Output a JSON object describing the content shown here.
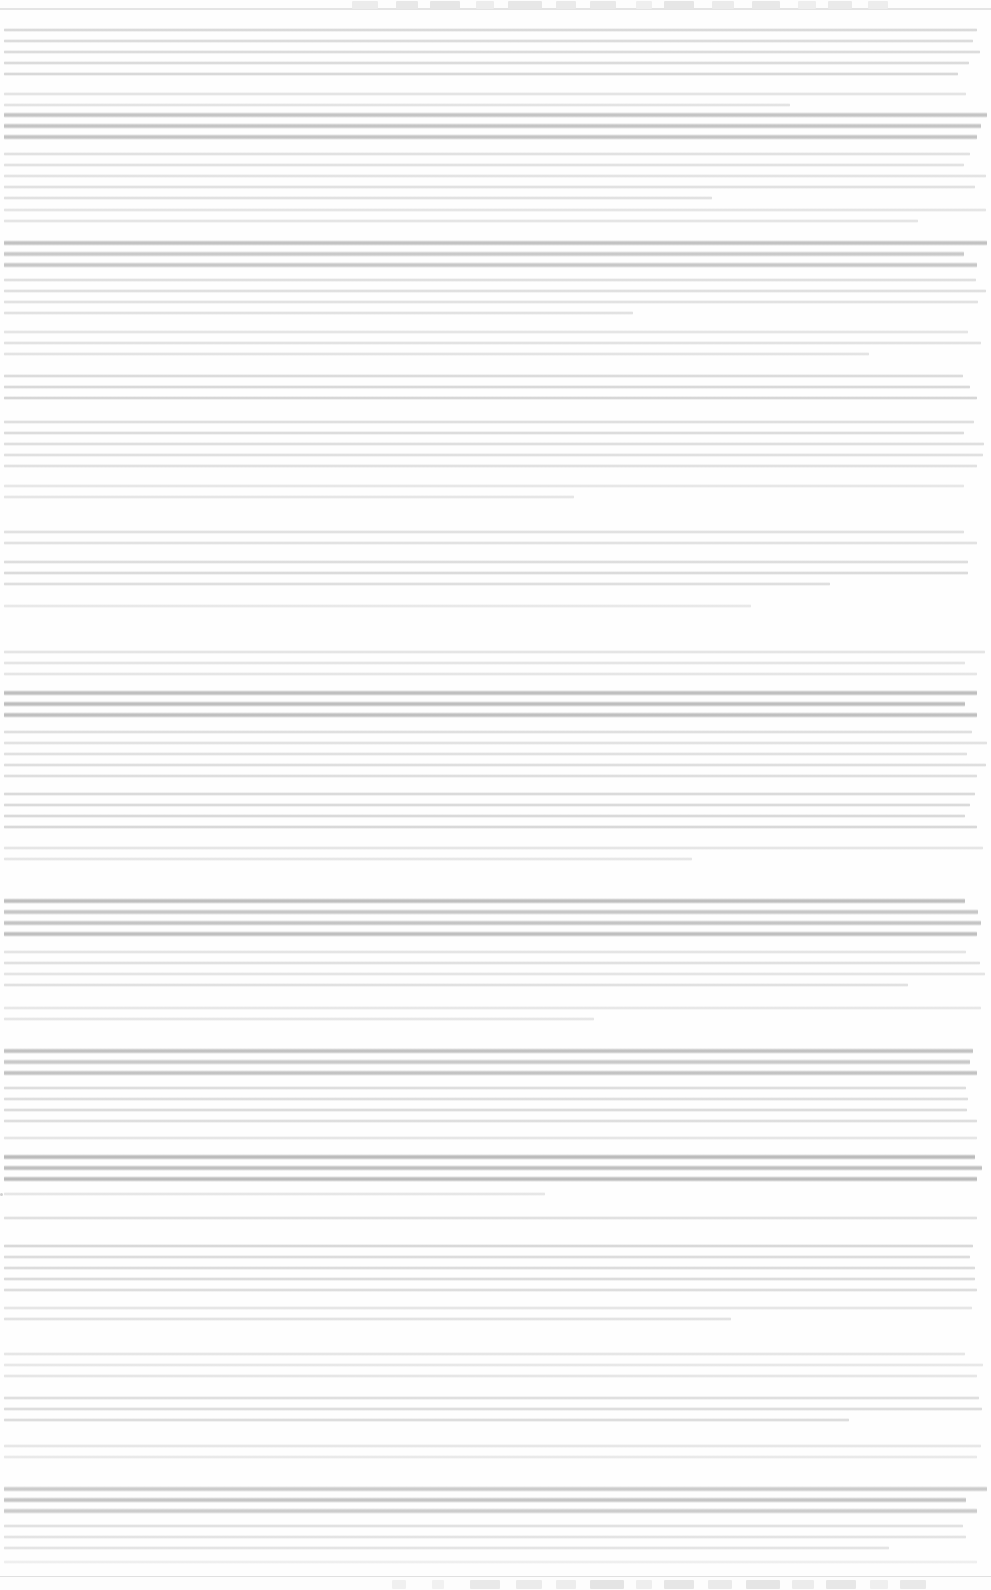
{
  "meta": {
    "width": 991,
    "height": 1590,
    "background": "#ffffff",
    "legibility": "none",
    "note": "Screenshot is extremely faded / washed out. No glyph shapes, labels, numbers or icon details are resolvable at any zoom level. Only horizontal text-line streaks, paragraph block boundaries and two chrome strips remain visible, so only geometry and tone are recorded below."
  },
  "window_chrome": {
    "name": "top-tab-strip",
    "top": 0,
    "height": 10,
    "background": "#fdfdfd",
    "rule_color": "#e4e4e4",
    "blocks": [
      {
        "x": 352,
        "w": 26,
        "tone": "#ececec"
      },
      {
        "x": 396,
        "w": 22,
        "tone": "#e8e8e8"
      },
      {
        "x": 430,
        "w": 30,
        "tone": "#e6e6e6"
      },
      {
        "x": 476,
        "w": 18,
        "tone": "#ededed"
      },
      {
        "x": 508,
        "w": 34,
        "tone": "#e7e7e7"
      },
      {
        "x": 556,
        "w": 20,
        "tone": "#eaeaea"
      },
      {
        "x": 590,
        "w": 26,
        "tone": "#e9e9e9"
      },
      {
        "x": 636,
        "w": 16,
        "tone": "#efefef"
      },
      {
        "x": 664,
        "w": 30,
        "tone": "#e6e6e6"
      },
      {
        "x": 712,
        "w": 22,
        "tone": "#ebebeb"
      },
      {
        "x": 752,
        "w": 28,
        "tone": "#e8e8e8"
      },
      {
        "x": 798,
        "w": 18,
        "tone": "#eeeeee"
      },
      {
        "x": 828,
        "w": 24,
        "tone": "#eaeaea"
      },
      {
        "x": 868,
        "w": 20,
        "tone": "#ededed"
      }
    ]
  },
  "taskbar": {
    "name": "bottom-taskbar",
    "height": 14,
    "background": "#fdfdfd",
    "rule_color": "#e0e0e0",
    "blocks": [
      {
        "x": 392,
        "w": 14,
        "tone": "#f0f0f0"
      },
      {
        "x": 432,
        "w": 12,
        "tone": "#f1f1f1"
      },
      {
        "x": 470,
        "w": 30,
        "tone": "#e9e9e9"
      },
      {
        "x": 516,
        "w": 26,
        "tone": "#ebebeb"
      },
      {
        "x": 556,
        "w": 20,
        "tone": "#ededed"
      },
      {
        "x": 590,
        "w": 34,
        "tone": "#e4e4e4"
      },
      {
        "x": 636,
        "w": 16,
        "tone": "#eeeeee"
      },
      {
        "x": 664,
        "w": 30,
        "tone": "#e6e6e6"
      },
      {
        "x": 708,
        "w": 24,
        "tone": "#eaeaea"
      },
      {
        "x": 746,
        "w": 34,
        "tone": "#e5e5e5"
      },
      {
        "x": 792,
        "w": 22,
        "tone": "#ececec"
      },
      {
        "x": 826,
        "w": 30,
        "tone": "#e7e7e7"
      },
      {
        "x": 870,
        "w": 18,
        "tone": "#efefef"
      },
      {
        "x": 900,
        "w": 26,
        "tone": "#e9e9e9"
      }
    ]
  },
  "document": {
    "name": "document-body",
    "left_margin": 4,
    "right_margin": 4,
    "line_pitch": 11,
    "blocks": [
      {
        "role": "paragraph",
        "top": 28,
        "lines": 5,
        "tone": "#d8d8d8",
        "last_line_frac": 0.97
      },
      {
        "role": "paragraph",
        "top": 92,
        "lines": 2,
        "tone": "#e2e2e2",
        "last_line_frac": 0.8
      },
      {
        "role": "heading",
        "top": 112,
        "lines": 3,
        "tone": "#c2c2c2",
        "last_line_frac": 0.99
      },
      {
        "role": "paragraph",
        "top": 152,
        "lines": 5,
        "tone": "#e0e0e0",
        "last_line_frac": 0.72
      },
      {
        "role": "paragraph",
        "top": 208,
        "lines": 2,
        "tone": "#e4e4e4",
        "last_line_frac": 0.93
      },
      {
        "role": "heading",
        "top": 240,
        "lines": 3,
        "tone": "#c0c0c0",
        "last_line_frac": 0.99
      },
      {
        "role": "paragraph",
        "top": 278,
        "lines": 4,
        "tone": "#dedede",
        "last_line_frac": 0.64
      },
      {
        "role": "paragraph",
        "top": 330,
        "lines": 3,
        "tone": "#e2e2e2",
        "last_line_frac": 0.88
      },
      {
        "role": "paragraph",
        "top": 374,
        "lines": 3,
        "tone": "#d6d6d6",
        "last_line_frac": 0.99
      },
      {
        "role": "paragraph",
        "top": 420,
        "lines": 5,
        "tone": "#dcdcdc",
        "last_line_frac": 0.99
      },
      {
        "role": "paragraph",
        "top": 484,
        "lines": 2,
        "tone": "#e6e6e6",
        "last_line_frac": 0.58
      },
      {
        "role": "paragraph",
        "top": 530,
        "lines": 2,
        "tone": "#e0e0e0",
        "last_line_frac": 0.99
      },
      {
        "role": "paragraph",
        "top": 560,
        "lines": 3,
        "tone": "#dadada",
        "last_line_frac": 0.84
      },
      {
        "role": "paragraph",
        "top": 604,
        "lines": 1,
        "tone": "#e8e8e8",
        "last_line_frac": 0.76
      },
      {
        "role": "paragraph",
        "top": 650,
        "lines": 3,
        "tone": "#e2e2e2",
        "last_line_frac": 0.99
      },
      {
        "role": "heading",
        "top": 690,
        "lines": 3,
        "tone": "#bdbdbd",
        "last_line_frac": 0.99
      },
      {
        "role": "paragraph",
        "top": 730,
        "lines": 5,
        "tone": "#dedede",
        "last_line_frac": 0.99
      },
      {
        "role": "paragraph",
        "top": 792,
        "lines": 4,
        "tone": "#d8d8d8",
        "last_line_frac": 0.99
      },
      {
        "role": "paragraph",
        "top": 846,
        "lines": 2,
        "tone": "#e4e4e4",
        "last_line_frac": 0.7
      },
      {
        "role": "heading",
        "top": 898,
        "lines": 4,
        "tone": "#bebebe",
        "last_line_frac": 0.99
      },
      {
        "role": "paragraph",
        "top": 950,
        "lines": 4,
        "tone": "#e0e0e0",
        "last_line_frac": 0.92
      },
      {
        "role": "paragraph",
        "top": 1006,
        "lines": 2,
        "tone": "#e6e6e6",
        "last_line_frac": 0.6
      },
      {
        "role": "heading",
        "top": 1048,
        "lines": 3,
        "tone": "#c2c2c2",
        "last_line_frac": 0.99
      },
      {
        "role": "paragraph",
        "top": 1086,
        "lines": 4,
        "tone": "#dcdcdc",
        "last_line_frac": 0.99
      },
      {
        "role": "paragraph",
        "top": 1136,
        "lines": 1,
        "tone": "#e4e4e4",
        "last_line_frac": 0.99
      },
      {
        "role": "heading",
        "top": 1154,
        "lines": 3,
        "tone": "#b8b8b8",
        "last_line_frac": 0.99
      },
      {
        "role": "list-item",
        "top": 1192,
        "lines": 1,
        "tone": "#e6e6e6",
        "last_line_frac": 0.55,
        "bullet": true
      },
      {
        "role": "paragraph",
        "top": 1216,
        "lines": 1,
        "tone": "#dedede",
        "last_line_frac": 0.99
      },
      {
        "role": "paragraph",
        "top": 1244,
        "lines": 5,
        "tone": "#d8d8d8",
        "last_line_frac": 0.99
      },
      {
        "role": "paragraph",
        "top": 1306,
        "lines": 2,
        "tone": "#e2e2e2",
        "last_line_frac": 0.74
      },
      {
        "role": "paragraph",
        "top": 1352,
        "lines": 3,
        "tone": "#e4e4e4",
        "last_line_frac": 0.99
      },
      {
        "role": "paragraph",
        "top": 1396,
        "lines": 3,
        "tone": "#dcdcdc",
        "last_line_frac": 0.86
      },
      {
        "role": "paragraph",
        "top": 1444,
        "lines": 2,
        "tone": "#e6e6e6",
        "last_line_frac": 0.99
      },
      {
        "role": "heading",
        "top": 1486,
        "lines": 3,
        "tone": "#c4c4c4",
        "last_line_frac": 0.99
      },
      {
        "role": "paragraph",
        "top": 1524,
        "lines": 3,
        "tone": "#e0e0e0",
        "last_line_frac": 0.9
      },
      {
        "role": "paragraph",
        "top": 1560,
        "lines": 1,
        "tone": "#ededed",
        "last_line_frac": 0.99
      }
    ]
  }
}
